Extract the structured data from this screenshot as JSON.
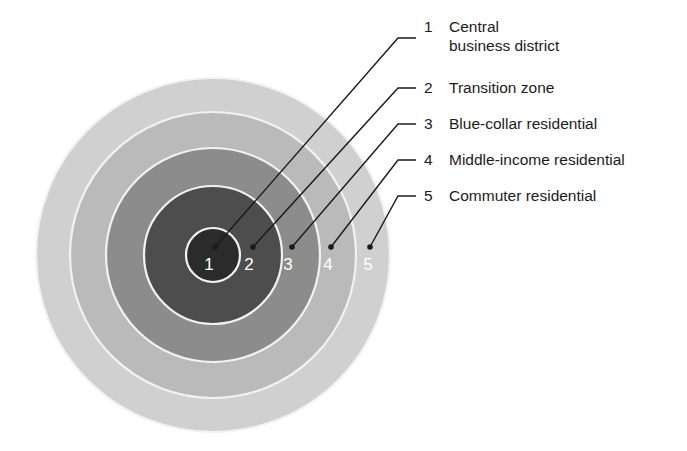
{
  "figure": {
    "type": "concentric-zone-diagram",
    "background_color": "#ffffff",
    "center": {
      "x": 213,
      "y": 255
    },
    "separator_color": "#f2f2f2",
    "leader_color": "#1b1b1b",
    "number_color": "#ffffff"
  },
  "zones": [
    {
      "number": "1",
      "label": "Central",
      "label_line2": "business district",
      "label_full": "Central business district",
      "color": "#2b2b2b",
      "radius": 27,
      "number_x": 209,
      "number_y": 270,
      "dot_x": 215,
      "dot_y": 247,
      "elbow_x": 398,
      "elbow_y": 38,
      "end_x": 416,
      "end_y": 38
    },
    {
      "number": "2",
      "label": "Transition zone",
      "label_line2": "",
      "label_full": "Transition zone",
      "color": "#4d4d4d",
      "radius": 69,
      "number_x": 249,
      "number_y": 270,
      "dot_x": 253,
      "dot_y": 247,
      "elbow_x": 398,
      "elbow_y": 88,
      "end_x": 416,
      "end_y": 88
    },
    {
      "number": "3",
      "label": "Blue-collar residential",
      "label_line2": "",
      "label_full": "Blue-collar residential",
      "color": "#8c8c8c",
      "radius": 107,
      "number_x": 288,
      "number_y": 270,
      "dot_x": 292,
      "dot_y": 247,
      "elbow_x": 398,
      "elbow_y": 124,
      "end_x": 416,
      "end_y": 124
    },
    {
      "number": "4",
      "label": "Middle-income residential",
      "label_line2": "",
      "label_full": "Middle-income residential",
      "color": "#bababa",
      "radius": 143,
      "number_x": 328,
      "number_y": 270,
      "dot_x": 331,
      "dot_y": 247,
      "elbow_x": 398,
      "elbow_y": 160,
      "end_x": 416,
      "end_y": 160
    },
    {
      "number": "5",
      "label": "Commuter residential",
      "label_line2": "",
      "label_full": "Commuter residential",
      "color": "#d0d0d0",
      "radius": 177,
      "number_x": 368,
      "number_y": 270,
      "dot_x": 370,
      "dot_y": 247,
      "elbow_x": 398,
      "elbow_y": 196,
      "end_x": 416,
      "end_y": 196
    }
  ],
  "legend": {
    "rows": [
      {
        "index": "1",
        "line1": "Central",
        "line2": "business district",
        "top": 17
      },
      {
        "index": "2",
        "line1": "Transition zone",
        "line2": "",
        "top": 78
      },
      {
        "index": "3",
        "line1": "Blue-collar residential",
        "line2": "",
        "top": 114
      },
      {
        "index": "4",
        "line1": "Middle-income residential",
        "line2": "",
        "top": 150
      },
      {
        "index": "5",
        "line1": "Commuter residential",
        "line2": "",
        "top": 186
      }
    ]
  }
}
